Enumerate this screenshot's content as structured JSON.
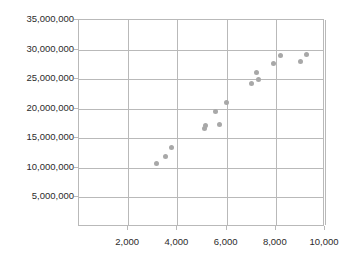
{
  "chart_data": {
    "type": "scatter",
    "title": "",
    "xlabel": "",
    "ylabel": "",
    "xlim": [
      0,
      10000
    ],
    "ylim": [
      0,
      35000000
    ],
    "grid": true,
    "legend": null,
    "marker_color": "#a8a8a8",
    "grid_color": "#b9b9b9",
    "x_ticks": [
      2000,
      4000,
      6000,
      8000,
      10000
    ],
    "x_tick_labels": [
      "2,000",
      "4,000",
      "6,000",
      "8,000",
      "10,000"
    ],
    "y_ticks": [
      5000000,
      10000000,
      15000000,
      20000000,
      25000000,
      30000000,
      35000000
    ],
    "y_tick_labels": [
      "5,000,000",
      "10,000,000",
      "15,000,000",
      "20,000,000",
      "25,000,000",
      "30,000,000",
      "35,000,000"
    ],
    "points": [
      {
        "x": 3150,
        "y": 10800000
      },
      {
        "x": 3500,
        "y": 11900000
      },
      {
        "x": 3750,
        "y": 13400000
      },
      {
        "x": 5100,
        "y": 16600000
      },
      {
        "x": 5150,
        "y": 17200000
      },
      {
        "x": 5550,
        "y": 19600000
      },
      {
        "x": 5700,
        "y": 17300000
      },
      {
        "x": 6000,
        "y": 21000000
      },
      {
        "x": 7000,
        "y": 24300000
      },
      {
        "x": 7200,
        "y": 26100000
      },
      {
        "x": 7300,
        "y": 24900000
      },
      {
        "x": 7900,
        "y": 27600000
      },
      {
        "x": 8200,
        "y": 29000000
      },
      {
        "x": 9000,
        "y": 28000000
      },
      {
        "x": 9250,
        "y": 29100000
      }
    ]
  }
}
